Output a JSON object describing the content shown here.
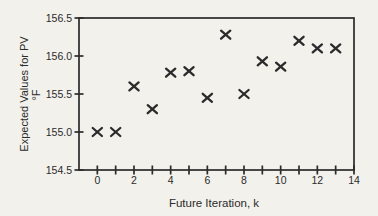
{
  "figure": {
    "description_label": "scatter chart of expected values for PV versus future iteration"
  },
  "chart_data": {
    "type": "scatter",
    "marker": "x",
    "title": "",
    "xlabel": "Future Iteration, k",
    "ylabel_line1": "Expected Values for PV",
    "ylabel_line2": "°F",
    "x": [
      0,
      1,
      2,
      3,
      4,
      5,
      6,
      7,
      8,
      9,
      10,
      11,
      12,
      13
    ],
    "y": [
      155.0,
      155.0,
      155.6,
      155.3,
      155.78,
      155.8,
      155.45,
      156.28,
      155.5,
      155.93,
      155.86,
      156.2,
      156.1,
      156.1
    ],
    "xlim": [
      -1,
      14
    ],
    "ylim": [
      154.5,
      156.5
    ],
    "x_ticks": [
      0,
      1,
      2,
      3,
      4,
      5,
      6,
      7,
      8,
      9,
      10,
      11,
      12,
      13,
      14
    ],
    "x_labeled_ticks": [
      0,
      2,
      4,
      6,
      8,
      10,
      12,
      14
    ],
    "x_tick_labels": [
      "0",
      "2",
      "4",
      "6",
      "8",
      "10",
      "12",
      "14"
    ],
    "y_ticks": [
      154.5,
      155.0,
      155.5,
      156.0,
      156.5
    ],
    "y_tick_labels": [
      "154.5",
      "155.0",
      "155.5",
      "156.0",
      "156.5"
    ],
    "grid": false,
    "legend": false,
    "ink_color": "#2b2b2b",
    "paper_color": "#f2f1ec"
  }
}
